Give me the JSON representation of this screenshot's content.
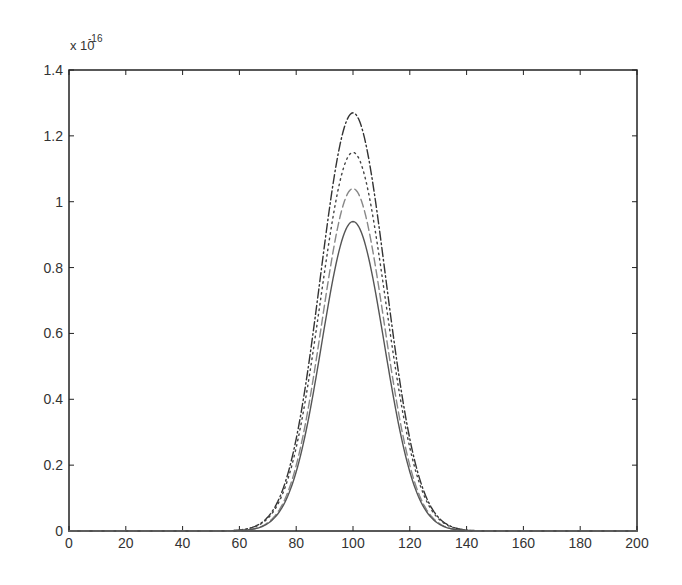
{
  "chart_data": {
    "type": "line",
    "title": "",
    "xlabel": "",
    "ylabel": "",
    "y_scale_label": "x 10",
    "y_scale_exponent": "-16",
    "xlim": [
      0,
      200
    ],
    "ylim": [
      0,
      1.4
    ],
    "xticks": [
      0,
      20,
      40,
      60,
      80,
      100,
      120,
      140,
      160,
      180,
      200
    ],
    "yticks": [
      0,
      0.2,
      0.4,
      0.6,
      0.8,
      1,
      1.2,
      1.4
    ],
    "ytick_labels": [
      "0",
      "0.2",
      "0.4",
      "0.6",
      "0.8",
      "1",
      "1.2",
      "1.4"
    ],
    "grid": false,
    "legend": null,
    "series": [
      {
        "name": "dash-dot",
        "style": "dashdot",
        "color": "#333333",
        "center": 100,
        "peak": 1.27,
        "sigma": 11.5
      },
      {
        "name": "dotted",
        "style": "dotted",
        "color": "#444444",
        "center": 100,
        "peak": 1.15,
        "sigma": 11.5
      },
      {
        "name": "dashed",
        "style": "dashed",
        "color": "#888888",
        "center": 100,
        "peak": 1.04,
        "sigma": 11.0
      },
      {
        "name": "solid",
        "style": "solid",
        "color": "#555555",
        "center": 100,
        "peak": 0.94,
        "sigma": 11.0
      }
    ],
    "sampled_points": {
      "x": [
        0,
        60,
        70,
        80,
        90,
        100,
        110,
        120,
        130,
        140,
        200
      ],
      "dash-dot": [
        0,
        0.003,
        0.04,
        0.28,
        0.87,
        1.27,
        0.87,
        0.28,
        0.04,
        0.003,
        0
      ],
      "dotted": [
        0,
        0.003,
        0.04,
        0.25,
        0.79,
        1.15,
        0.79,
        0.25,
        0.04,
        0.003,
        0
      ],
      "dashed": [
        0,
        0.002,
        0.03,
        0.2,
        0.69,
        1.04,
        0.69,
        0.2,
        0.03,
        0.002,
        0
      ],
      "solid": [
        0,
        0.002,
        0.03,
        0.18,
        0.62,
        0.94,
        0.62,
        0.18,
        0.03,
        0.002,
        0
      ]
    }
  }
}
